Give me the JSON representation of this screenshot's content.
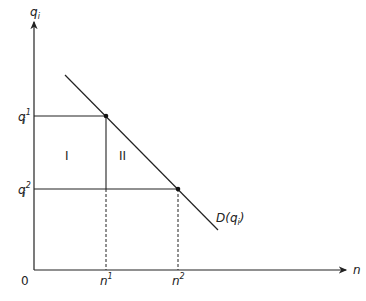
{
  "diagram": {
    "y_axis_label": "q",
    "y_axis_sub": "i",
    "x_axis_label": "n",
    "origin_label": "0",
    "q1_label": "q",
    "q1_sub": "i",
    "q1_sup": "1",
    "q2_label": "q",
    "q2_sub": "i",
    "q2_sup": "2",
    "n1_label": "n",
    "n1_sup": "1",
    "n2_label": "n",
    "n2_sup": "2",
    "region_1": "I",
    "region_2": "II",
    "curve_label": "D(q",
    "curve_sub": "i",
    "curve_close": ")",
    "line_color": "#222222"
  }
}
